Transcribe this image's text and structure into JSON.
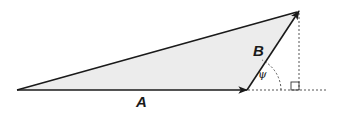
{
  "diagram": {
    "colors": {
      "stroke": "#1a1a1a",
      "fill": "#ececec",
      "dashed": "#555555"
    },
    "vectors": [
      {
        "name": "A",
        "label": "A",
        "from": [
          17,
          90
        ],
        "to": [
          247,
          90
        ]
      },
      {
        "name": "B",
        "label": "B",
        "from": [
          247,
          90
        ],
        "to": [
          299,
          11
        ]
      },
      {
        "name": "resultant",
        "label": "",
        "from": [
          17,
          90
        ],
        "to": [
          299,
          11
        ]
      }
    ],
    "angle": {
      "symbol": "ψ",
      "vertex": [
        247,
        90
      ]
    },
    "right_angle_marker": {
      "corner": [
        299,
        90
      ],
      "size": 8
    },
    "labels": {
      "A": "A",
      "B": "B",
      "psi": "ψ"
    }
  }
}
